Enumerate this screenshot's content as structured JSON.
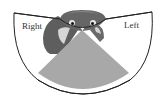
{
  "figure": {
    "type": "visual-field-diagram",
    "labels": {
      "right_field": "Right",
      "left_field": "Left"
    },
    "regions": [
      {
        "name": "right monocular field",
        "fill": "#ffffff"
      },
      {
        "name": "binocular overlap",
        "fill": "#a8a8a8"
      },
      {
        "name": "left monocular field",
        "fill": "#ffffff"
      }
    ],
    "colors": {
      "outline": "#222222",
      "binocular": "#a8a8a8",
      "bird_dark": "#5e5e5e",
      "bird_light": "#d9d9d9"
    }
  }
}
